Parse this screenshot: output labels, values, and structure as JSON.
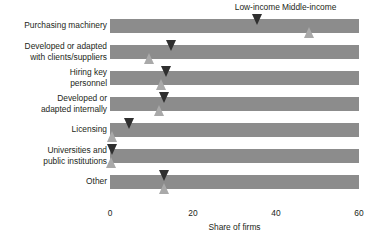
{
  "chart_data": {
    "type": "bar",
    "title": "",
    "subtitle": "",
    "xlabel": "Share of firms",
    "ylabel": "",
    "xlim": [
      0,
      60
    ],
    "xticks": [
      0,
      20,
      40,
      60
    ],
    "xtick_labels": [
      "0",
      "20",
      "40",
      "60"
    ],
    "grid": false,
    "legend_position": "top",
    "orientation": "horizontal",
    "note": "Each category row is a full-width gray band; two marker glyphs per row indicate the Low-income (dark down-pointing triangle) and Middle-income (light up-pointing triangle) values.",
    "categories": [
      "Purchasing machinery",
      "Developed or adapted\nwith clients/suppliers",
      "Hiring key\npersonnel",
      "Developed or\nadapted internally",
      "Licensing",
      "Universities and\npublic institutions",
      "Other"
    ],
    "series": [
      {
        "name": "Low-income",
        "marker": "down-triangle",
        "color": "#2f2f2f",
        "values": [
          35.5,
          14.9,
          13.7,
          13.2,
          4.8,
          0.5,
          13.2
        ]
      },
      {
        "name": "Middle-income",
        "marker": "up-triangle",
        "color": "#a9a9a9",
        "values": [
          48.0,
          9.6,
          12.5,
          12.0,
          0.7,
          0.3,
          13.2
        ]
      }
    ],
    "bar_color": "#8c8c8c",
    "legend": [
      {
        "label": "Low-income",
        "x_value": 35.5
      },
      {
        "label": "Middle-income",
        "x_value": 48.0
      }
    ]
  }
}
